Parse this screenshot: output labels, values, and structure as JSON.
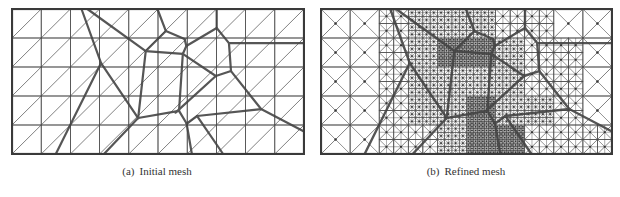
{
  "figure": {
    "panels": [
      {
        "id": "a",
        "label": "(a)",
        "caption": "Initial mesh",
        "x": 11,
        "y": 8,
        "width": 292,
        "height": 145,
        "caption_center_x": 157
      },
      {
        "id": "b",
        "label": "(b)",
        "caption": "Refined mesh",
        "x": 320,
        "y": 8,
        "width": 291,
        "height": 145,
        "caption_center_x": 466
      }
    ],
    "caption_y": 172,
    "mesh": {
      "columns": 10,
      "rows": 5,
      "diagonal": "bottom-left-to-top-right",
      "grid_color": "#4a4a4a",
      "border_color": "#3a3a3a",
      "boundary_color": "#444444"
    },
    "grain_boundaries": [
      [
        [
          0.238,
          0.0
        ],
        [
          0.305,
          0.373
        ]
      ],
      [
        [
          0.258,
          0.0
        ],
        [
          0.458,
          0.29
        ]
      ],
      [
        [
          0.305,
          0.373
        ],
        [
          0.432,
          0.752
        ]
      ],
      [
        [
          0.305,
          0.373
        ],
        [
          0.15,
          1.0
        ]
      ],
      [
        [
          0.432,
          0.752
        ],
        [
          0.315,
          1.0
        ]
      ],
      [
        [
          0.432,
          0.752
        ],
        [
          0.458,
          0.29
        ]
      ],
      [
        [
          0.498,
          0.0
        ],
        [
          0.527,
          0.152
        ]
      ],
      [
        [
          0.458,
          0.29
        ],
        [
          0.527,
          0.152
        ]
      ],
      [
        [
          0.527,
          0.152
        ],
        [
          0.591,
          0.207
        ]
      ],
      [
        [
          0.591,
          0.207
        ],
        [
          0.597,
          0.255
        ]
      ],
      [
        [
          0.458,
          0.29
        ],
        [
          0.585,
          0.31
        ]
      ],
      [
        [
          0.585,
          0.31
        ],
        [
          0.597,
          0.255
        ]
      ],
      [
        [
          0.597,
          0.255
        ],
        [
          0.701,
          0.131
        ]
      ],
      [
        [
          0.701,
          0.0
        ],
        [
          0.701,
          0.131
        ]
      ],
      [
        [
          0.701,
          0.131
        ],
        [
          0.743,
          0.235
        ]
      ],
      [
        [
          0.743,
          0.235
        ],
        [
          1.0,
          0.235
        ]
      ],
      [
        [
          0.743,
          0.235
        ],
        [
          0.75,
          0.428
        ]
      ],
      [
        [
          0.75,
          0.428
        ],
        [
          0.698,
          0.462
        ]
      ],
      [
        [
          0.698,
          0.462
        ],
        [
          0.585,
          0.31
        ]
      ],
      [
        [
          0.585,
          0.31
        ],
        [
          0.572,
          0.703
        ]
      ],
      [
        [
          0.572,
          0.703
        ],
        [
          0.432,
          0.752
        ]
      ],
      [
        [
          0.572,
          0.703
        ],
        [
          0.598,
          0.79
        ]
      ],
      [
        [
          0.598,
          0.79
        ],
        [
          0.616,
          1.0
        ]
      ],
      [
        [
          0.598,
          0.79
        ],
        [
          0.634,
          0.738
        ]
      ],
      [
        [
          0.634,
          0.738
        ],
        [
          0.723,
          1.0
        ]
      ],
      [
        [
          0.634,
          0.738
        ],
        [
          0.853,
          0.69
        ]
      ],
      [
        [
          0.75,
          0.428
        ],
        [
          0.853,
          0.69
        ]
      ],
      [
        [
          0.853,
          0.69
        ],
        [
          1.0,
          0.845
        ]
      ],
      [
        [
          0.698,
          0.462
        ],
        [
          0.56,
          0.715
        ]
      ],
      [
        [
          0.427,
          0.0
        ],
        [
          0.0,
          0.0
        ]
      ]
    ],
    "refinement_levels": [
      [
        1,
        1,
        2,
        3,
        3,
        3,
        2,
        2,
        1,
        1
      ],
      [
        1,
        1,
        2,
        3,
        4,
        4,
        3,
        2,
        2,
        1
      ],
      [
        1,
        1,
        2,
        3,
        3,
        3,
        3,
        2,
        2,
        1
      ],
      [
        1,
        1,
        2,
        3,
        3,
        4,
        3,
        3,
        2,
        1
      ],
      [
        1,
        1,
        2,
        2,
        3,
        4,
        4,
        2,
        2,
        2
      ]
    ]
  }
}
